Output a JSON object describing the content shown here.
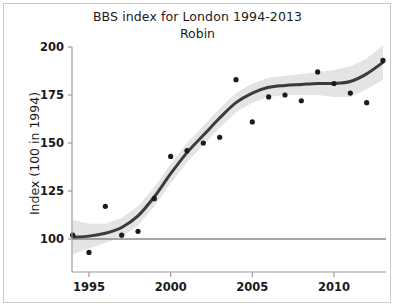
{
  "chart_data": {
    "type": "scatter",
    "title": "BBS index for London 1994-2013",
    "subtitle": "Robin",
    "xlabel": "",
    "ylabel": "Index (100 in 1994)",
    "xlim": [
      1993.6,
      2013.6
    ],
    "ylim": [
      90,
      202
    ],
    "xticks": [
      1995,
      2000,
      2005,
      2010
    ],
    "yticks": [
      100,
      125,
      150,
      175,
      200
    ],
    "grid": false,
    "legend": null,
    "reference_line": {
      "y": 100,
      "label": "",
      "color": "#8a8a8a"
    },
    "point_color": "#1a1a1a",
    "line_color": "#3b3b3b",
    "band_color": "#e3e3e3",
    "x": [
      1994,
      1995,
      1996,
      1997,
      1998,
      1999,
      2000,
      2001,
      2002,
      2003,
      2004,
      2005,
      2006,
      2007,
      2008,
      2009,
      2010,
      2011,
      2012,
      2013
    ],
    "values": [
      102,
      93,
      117,
      102,
      104,
      121,
      143,
      146,
      150,
      153,
      183,
      161,
      174,
      175,
      172,
      187,
      181,
      176,
      171,
      193
    ],
    "series": [
      {
        "name": "Annual index",
        "type": "scatter",
        "values": [
          102,
          93,
          117,
          102,
          104,
          121,
          143,
          146,
          150,
          153,
          183,
          161,
          174,
          175,
          172,
          187,
          181,
          176,
          171,
          193
        ]
      },
      {
        "name": "Smoothed trend",
        "type": "line",
        "values": [
          101,
          101.5,
          103,
          106,
          112,
          122,
          134,
          145,
          154,
          163,
          171,
          176,
          179,
          180,
          180.5,
          181,
          181,
          182,
          186,
          192
        ]
      },
      {
        "name": "Confidence band upper",
        "type": "band",
        "values": [
          110,
          108,
          108,
          111,
          117,
          127,
          139,
          150,
          159,
          168,
          176,
          181,
          184,
          185,
          186,
          187,
          188,
          190,
          194,
          201
        ]
      },
      {
        "name": "Confidence band lower",
        "type": "band",
        "values": [
          92,
          95,
          98,
          101,
          107,
          117,
          129,
          140,
          149,
          158,
          166,
          171,
          174,
          175,
          175,
          175,
          174,
          174,
          178,
          183
        ]
      }
    ]
  },
  "axis": {
    "x_tick_labels": [
      "1995",
      "2000",
      "2005",
      "2010"
    ],
    "y_tick_labels": [
      "100",
      "125",
      "150",
      "175",
      "200"
    ],
    "y_axis_title": "Index (100 in 1994)"
  }
}
